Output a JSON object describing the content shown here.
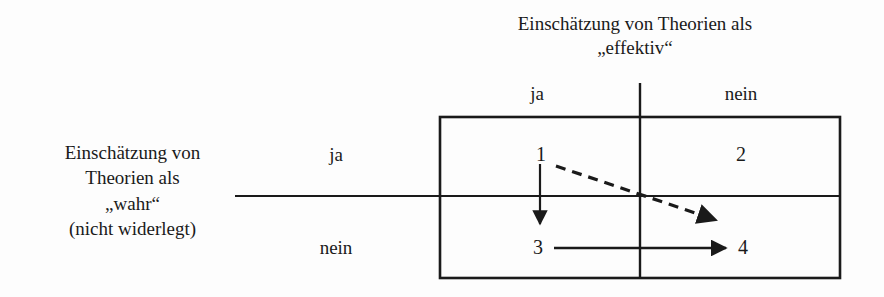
{
  "figure": {
    "background_color": "#fdfdfd",
    "ink_color": "#1a1a1a",
    "column_axis": {
      "title_line1": "Einschätzung von Theorien als",
      "title_line2": "„effektiv“",
      "headers": [
        "ja",
        "nein"
      ]
    },
    "row_axis": {
      "title_line1": "Einschätzung von",
      "title_line2": "Theorien als",
      "title_line3": "„wahr“",
      "title_line4": "(nicht widerlegt)",
      "headers": [
        "ja",
        "nein"
      ]
    },
    "cells": [
      {
        "id": "cell-1",
        "label": "1",
        "row": "ja",
        "column": "ja"
      },
      {
        "id": "cell-2",
        "label": "2",
        "row": "ja",
        "column": "nein"
      },
      {
        "id": "cell-3",
        "label": "3",
        "row": "nein",
        "column": "ja"
      },
      {
        "id": "cell-4",
        "label": "4",
        "row": "nein",
        "column": "nein"
      }
    ],
    "arrows": [
      {
        "name": "arrow-1-to-3",
        "from": "1",
        "to": "3",
        "style": "solid",
        "direction": "down"
      },
      {
        "name": "arrow-1-to-4",
        "from": "1",
        "to": "4",
        "style": "dashed",
        "direction": "diagonal-down-right"
      },
      {
        "name": "arrow-3-to-4",
        "from": "3",
        "to": "4",
        "style": "solid",
        "direction": "right"
      }
    ]
  }
}
